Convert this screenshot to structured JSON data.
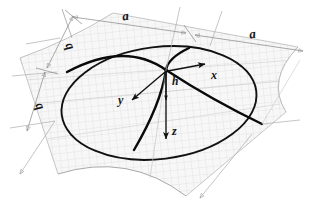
{
  "figure": {
    "background_color": "#ffffff",
    "width": 313,
    "height": 214,
    "line_colors": {
      "outline": "#0d0d0d",
      "meridian": "#000000",
      "dimension": "#8c8c8c",
      "grid": "#c9c9c9",
      "surface_fill": "#f2f2f2"
    }
  },
  "dimensions": [
    {
      "id": "a-top",
      "label": "a",
      "orientation": "along-top-left-edge",
      "rotation_deg": -7
    },
    {
      "id": "a-right",
      "label": "a",
      "orientation": "along-top-right-edge",
      "rotation_deg": -7
    },
    {
      "id": "b-upper",
      "label": "b",
      "orientation": "along-left-edge",
      "rotation_deg": -115
    },
    {
      "id": "b-lower",
      "label": "b",
      "orientation": "along-left-edge",
      "rotation_deg": -115
    }
  ],
  "axes": [
    {
      "id": "x-axis",
      "label": "x",
      "direction": "right-up",
      "origin": "apex"
    },
    {
      "id": "y-axis",
      "label": "y",
      "direction": "left-down",
      "origin": "apex"
    },
    {
      "id": "z-axis",
      "label": "z",
      "direction": "down",
      "origin": "apex"
    }
  ],
  "measures": [
    {
      "id": "height",
      "label": "h",
      "description": "rise from base plane to apex"
    }
  ],
  "annotations": {
    "apex_marker": "apex",
    "base_outline": "ellipse",
    "meridian_count": 2,
    "surface_hatch": "fine-square-grid"
  }
}
